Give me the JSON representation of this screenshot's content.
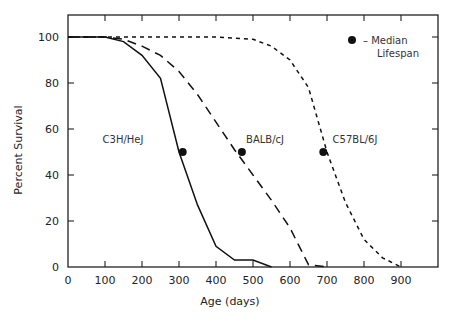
{
  "chart_data": {
    "type": "line",
    "title": "",
    "xlabel": "Age (days)",
    "ylabel": "Percent Survival",
    "xlim": [
      0,
      1000
    ],
    "ylim": [
      0,
      110
    ],
    "xticks": [
      0,
      100,
      200,
      300,
      400,
      500,
      600,
      700,
      800,
      900
    ],
    "yticks": [
      0,
      20,
      40,
      60,
      80,
      100
    ],
    "grid": false,
    "legend": {
      "marker": "filled-circle",
      "text_line1": "– Median",
      "text_line2": "Lifespan",
      "position": "top-right"
    },
    "series": [
      {
        "name": "C3H/HeJ",
        "style": "solid",
        "x": [
          0,
          100,
          150,
          200,
          250,
          300,
          350,
          400,
          450,
          500,
          550
        ],
        "y": [
          100,
          100,
          98,
          92,
          82,
          50,
          27,
          9,
          3,
          3,
          0
        ],
        "median": {
          "x": 310,
          "y": 50
        }
      },
      {
        "name": "BALB/cJ",
        "style": "dashed",
        "x": [
          0,
          100,
          150,
          200,
          250,
          300,
          350,
          400,
          450,
          500,
          550,
          600,
          650,
          700
        ],
        "y": [
          100,
          100,
          99,
          96,
          92,
          85,
          75,
          63,
          51,
          40,
          29,
          17,
          1,
          0
        ],
        "median": {
          "x": 470,
          "y": 50
        }
      },
      {
        "name": "C57BL/6J",
        "style": "dotted",
        "x": [
          0,
          100,
          200,
          300,
          400,
          500,
          550,
          600,
          650,
          700,
          750,
          800,
          850,
          900
        ],
        "y": [
          100,
          100,
          100,
          100,
          100,
          99,
          96,
          90,
          78,
          50,
          28,
          12,
          4,
          0
        ],
        "median": {
          "x": 690,
          "y": 50
        }
      }
    ]
  },
  "labels": {
    "xlabel": "Age (days)",
    "ylabel": "Percent Survival",
    "series": [
      "C3H/HeJ",
      "BALB/cJ",
      "C57BL/6J"
    ],
    "legend_line1": "– Median",
    "legend_line2": "Lifespan",
    "xticks": [
      "0",
      "100",
      "200",
      "300",
      "400",
      "500",
      "600",
      "700",
      "800",
      "900"
    ],
    "yticks": [
      "0",
      "20",
      "40",
      "60",
      "80",
      "100"
    ]
  }
}
